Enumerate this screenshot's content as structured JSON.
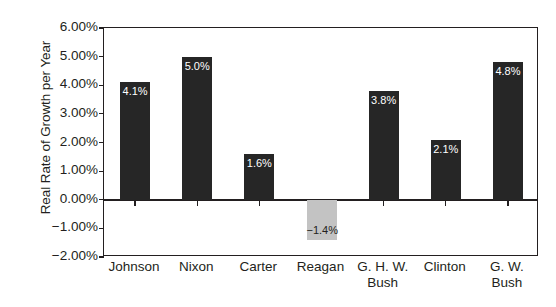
{
  "chart_data": {
    "type": "bar",
    "title": "",
    "xlabel": "",
    "ylabel": "Real Rate of Growth per Year",
    "categories": [
      "Johnson",
      "Nixon",
      "Carter",
      "Reagan",
      "G. H. W. Bush",
      "Clinton",
      "G. W. Bush"
    ],
    "category_lines": [
      [
        "Johnson"
      ],
      [
        "Nixon"
      ],
      [
        "Carter"
      ],
      [
        "Reagan"
      ],
      [
        "G. H. W.",
        "Bush"
      ],
      [
        "Clinton"
      ],
      [
        "G. W.",
        "Bush"
      ]
    ],
    "values": [
      4.1,
      5.0,
      1.6,
      -1.4,
      3.8,
      2.1,
      4.8
    ],
    "data_labels": [
      "4.1%",
      "5.0%",
      "1.6%",
      "−1.4%",
      "3.8%",
      "2.1%",
      "4.8%"
    ],
    "ylim": [
      -2.0,
      6.0
    ],
    "ytick_values": [
      6.0,
      5.0,
      4.0,
      3.0,
      2.0,
      1.0,
      0.0,
      -1.0,
      -2.0
    ],
    "ytick_labels": [
      "6.00%",
      "5.00%",
      "4.00%",
      "3.00%",
      "2.00%",
      "1.00%",
      "0.00%",
      "−1.00%",
      "−2.00%"
    ],
    "grid": false,
    "legend": false,
    "bar_colors": {
      "positive": "#262626",
      "negative": "#c3c3c3"
    },
    "axis_color": "#231f20",
    "background": "#ffffff"
  }
}
